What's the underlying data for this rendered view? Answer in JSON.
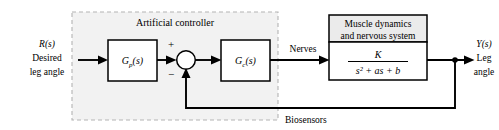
{
  "diagram": {
    "region": {
      "label": "Artificial controller"
    },
    "input": {
      "symbol": "R(s)",
      "line1": "Desired",
      "line2": "leg angle"
    },
    "output": {
      "symbol": "Y(s)",
      "line1": "Leg",
      "line2": "angle"
    },
    "blocks": {
      "prefilter": "G",
      "prefilter_sub": "p",
      "prefilter_arg": "(s)",
      "controller": "G",
      "controller_sub": "c",
      "controller_arg": "(s)",
      "plant_title_line1": "Muscle dynamics",
      "plant_title_line2": "and nervous system",
      "plant_numerator": "K",
      "plant_denominator": "s² + as + b"
    },
    "summing_junction": {
      "plus": "+",
      "minus": "−"
    },
    "signals": {
      "nerves": "Nerves",
      "biosensors": "Biosensors"
    },
    "colors": {
      "line": "#000000",
      "region_fill": "#f2f2f2",
      "region_stroke": "#b4b4b4",
      "block_header_fill": "#ebebeb",
      "background": "#ffffff"
    }
  }
}
